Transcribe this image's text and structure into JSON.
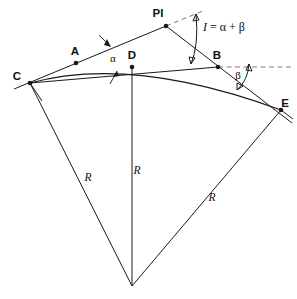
{
  "diagram": {
    "background_color": "#ffffff",
    "line_color": "#1a1a1a",
    "dashed_color": "#7a7a7a",
    "points": {
      "pi": {
        "label": "PI",
        "x": 166,
        "y": 26
      },
      "a": {
        "label": "A",
        "x": 76,
        "y": 63
      },
      "b": {
        "label": "B",
        "x": 218,
        "y": 67
      },
      "c": {
        "label": "C",
        "x": 30,
        "y": 83
      },
      "d": {
        "label": "D",
        "x": 132,
        "y": 67
      },
      "e": {
        "label": "E",
        "x": 281,
        "y": 110
      },
      "center": {
        "label": "",
        "x": 132,
        "y": 286
      }
    },
    "point_labels": {
      "pi": "PI",
      "a": "A",
      "b": "B",
      "c": "C",
      "d": "D",
      "e": "E"
    },
    "angles": {
      "alpha": "α",
      "beta": "β",
      "intersection": "I"
    },
    "formula": "I = α + β",
    "formula_parts": {
      "lhs": "I",
      "equals": "=",
      "alpha": "α",
      "plus": "+",
      "beta": "β"
    },
    "radii": [
      {
        "id": "radius-left",
        "label": "R",
        "x": 88,
        "y": 181
      },
      {
        "id": "radius-center",
        "label": "R",
        "x": 137,
        "y": 174
      },
      {
        "id": "radius-right",
        "label": "R",
        "x": 212,
        "y": 201
      }
    ],
    "radius_label": "R"
  }
}
